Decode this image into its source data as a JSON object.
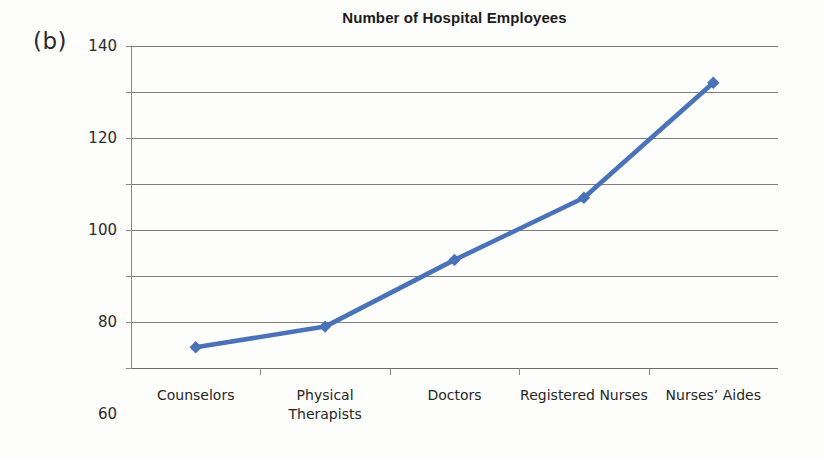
{
  "panel": {
    "label": "(b)"
  },
  "chart_data": {
    "type": "line",
    "title": "Number of Hospital Employees",
    "xlabel": "",
    "ylabel": "",
    "categories": [
      "Counselors",
      "Physical Therapists",
      "Doctors",
      "Registered Nurses",
      "Nurses’ Aides"
    ],
    "category_lines": [
      [
        "Counselors"
      ],
      [
        "Physical",
        "Therapists"
      ],
      [
        "Doctors"
      ],
      [
        "Registered Nurses"
      ],
      [
        "Nurses’ Aides"
      ]
    ],
    "values": [
      9,
      18,
      47,
      74,
      124
    ],
    "ylim": [
      0,
      140
    ],
    "ytick_step": 20,
    "ytick_labels": [
      "0",
      "20",
      "40",
      "60",
      "80",
      "100",
      "120",
      "140"
    ],
    "grid": true,
    "legend": "none",
    "series_color": "#4a72b8",
    "marker": "diamond",
    "gridline_color": "#7d7d7d"
  }
}
